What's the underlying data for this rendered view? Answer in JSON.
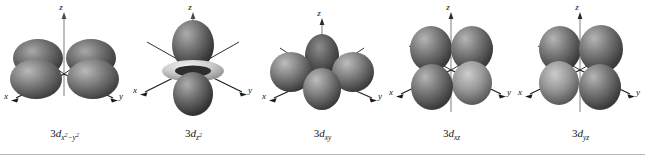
{
  "figure": {
    "background_color": "#ffffff",
    "rule_color": "#b9b9b9",
    "axis_color": "#1a1a1a",
    "lobe_color_dark": "#4a4a4a",
    "lobe_color_mid": "#7d7d7d",
    "lobe_color_light": "#d2d2d2",
    "torus_color": "#c9c9c9"
  },
  "axes": {
    "x_label": "x",
    "y_label": "y",
    "z_label": "z"
  },
  "orbitals": [
    {
      "id": "3dx2-y2",
      "shell": "3",
      "subshell": "d",
      "subscript": "x²−y²",
      "caption_plain": "3d x²−y²",
      "lobe_count": 4,
      "has_torus": false,
      "orientation": "lobes along x and y axes"
    },
    {
      "id": "3dz2",
      "shell": "3",
      "subshell": "d",
      "subscript": "z²",
      "caption_plain": "3d z²",
      "lobe_count": 2,
      "has_torus": true,
      "orientation": "lobes along z axis with equatorial torus"
    },
    {
      "id": "3dxy",
      "shell": "3",
      "subshell": "d",
      "subscript": "xy",
      "caption_plain": "3d xy",
      "lobe_count": 4,
      "has_torus": false,
      "orientation": "lobes between x and y axes"
    },
    {
      "id": "3dxz",
      "shell": "3",
      "subshell": "d",
      "subscript": "xz",
      "caption_plain": "3d xz",
      "lobe_count": 4,
      "has_torus": false,
      "orientation": "lobes between x and z axes"
    },
    {
      "id": "3dyz",
      "shell": "3",
      "subshell": "d",
      "subscript": "yz",
      "caption_plain": "3d yz",
      "lobe_count": 4,
      "has_torus": false,
      "orientation": "lobes between y and z axes"
    }
  ]
}
